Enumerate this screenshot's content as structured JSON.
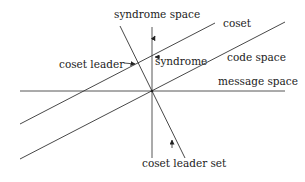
{
  "diagram": {
    "labels": {
      "syndrome_space": "syndrome space",
      "coset": "coset",
      "code_space": "code space",
      "message_space": "message space",
      "coset_leader": "coset leader",
      "syndrome": "syndrome",
      "coset_leader_set": "coset leader set"
    },
    "colors": {
      "line": "#333333",
      "text": "#222222",
      "background": "#ffffff"
    }
  }
}
